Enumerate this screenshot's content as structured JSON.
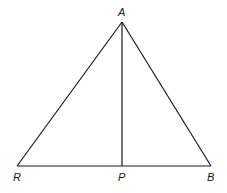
{
  "diagram": {
    "type": "triangle",
    "points": {
      "A": {
        "label": "A",
        "x": 122,
        "y": 22
      },
      "R": {
        "label": "R",
        "x": 17,
        "y": 166
      },
      "B": {
        "label": "B",
        "x": 211,
        "y": 166
      },
      "P": {
        "label": "P",
        "x": 122,
        "y": 166
      }
    },
    "segments": [
      "AR",
      "AB",
      "RB",
      "AP"
    ],
    "stroke_color": "#1a1a1a",
    "background": "#ffffff"
  }
}
